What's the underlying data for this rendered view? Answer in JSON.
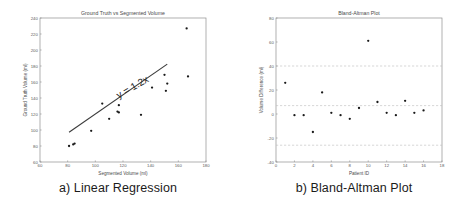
{
  "figure": {
    "panels": [
      {
        "caption": "a) Linear Regression",
        "chart_data": {
          "type": "scatter",
          "title": "Ground Truth vs Segmented Volume",
          "xlabel": "Segmented Volume (ml)",
          "ylabel": "Ground Truth Volume (ml)",
          "xlim": [
            60,
            180
          ],
          "ylim": [
            60,
            240
          ],
          "xticks": [
            60,
            80,
            100,
            120,
            140,
            160,
            180
          ],
          "yticks": [
            60,
            80,
            100,
            120,
            140,
            160,
            180,
            200,
            220,
            240
          ],
          "grid": true,
          "legend": "none",
          "annotations": [
            {
              "text": "y = 1.2x",
              "x": 128,
              "y": 150,
              "rotation": -30
            }
          ],
          "series": [
            {
              "name": "Patients",
              "marker": "dot",
              "points": [
                {
                  "x": 81,
                  "y": 80
                },
                {
                  "x": 84,
                  "y": 82
                },
                {
                  "x": 85,
                  "y": 83
                },
                {
                  "x": 97,
                  "y": 99
                },
                {
                  "x": 105,
                  "y": 133
                },
                {
                  "x": 110,
                  "y": 114
                },
                {
                  "x": 116,
                  "y": 123
                },
                {
                  "x": 117,
                  "y": 131
                },
                {
                  "x": 117,
                  "y": 122
                },
                {
                  "x": 133,
                  "y": 119
                },
                {
                  "x": 141,
                  "y": 153
                },
                {
                  "x": 150,
                  "y": 169
                },
                {
                  "x": 152,
                  "y": 158
                },
                {
                  "x": 151,
                  "y": 149
                },
                {
                  "x": 166,
                  "y": 227
                },
                {
                  "x": 167,
                  "y": 167
                }
              ]
            }
          ],
          "fit_line": {
            "equation": "y = 1.2x",
            "slope": 1.2,
            "intercept": 0,
            "x_start": 81,
            "x_end": 152
          }
        }
      },
      {
        "caption": "b) Bland-Altman Plot",
        "chart_data": {
          "type": "scatter",
          "title": "Bland-Altman Plot",
          "xlabel": "Patient ID",
          "ylabel": "Volume Difference (ml)",
          "xlim": [
            0,
            18
          ],
          "ylim": [
            -40,
            80
          ],
          "xticks": [
            0,
            2,
            4,
            6,
            8,
            10,
            12,
            14,
            16,
            18
          ],
          "yticks": [
            -40,
            -20,
            0,
            20,
            40,
            60,
            80
          ],
          "grid": false,
          "legend": "none",
          "reference_lines": [
            {
              "name": "upper-limit-of-agreement",
              "value": 40
            },
            {
              "name": "mean-bias",
              "value": 7
            },
            {
              "name": "lower-limit-of-agreement",
              "value": -26
            }
          ],
          "series": [
            {
              "name": "Patients",
              "marker": "dot",
              "points": [
                {
                  "x": 1,
                  "y": 26
                },
                {
                  "x": 2,
                  "y": -1
                },
                {
                  "x": 3,
                  "y": -1
                },
                {
                  "x": 4,
                  "y": -15
                },
                {
                  "x": 5,
                  "y": 18
                },
                {
                  "x": 6,
                  "y": 1
                },
                {
                  "x": 7,
                  "y": -1
                },
                {
                  "x": 8,
                  "y": -4
                },
                {
                  "x": 9,
                  "y": 5
                },
                {
                  "x": 10,
                  "y": 61
                },
                {
                  "x": 11,
                  "y": 10
                },
                {
                  "x": 12,
                  "y": 1
                },
                {
                  "x": 13,
                  "y": -1
                },
                {
                  "x": 14,
                  "y": 11
                },
                {
                  "x": 15,
                  "y": 1
                },
                {
                  "x": 16,
                  "y": 3
                }
              ]
            }
          ]
        }
      }
    ]
  }
}
